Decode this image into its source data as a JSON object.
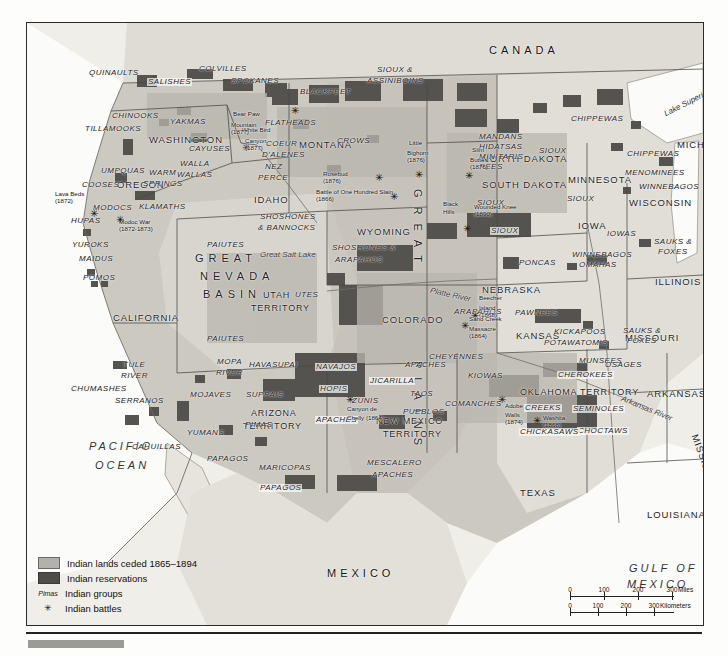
{
  "map": {
    "countries": [
      {
        "name": "CANADA",
        "x": 462,
        "y": 22
      },
      {
        "name": "MEXICO",
        "x": 300,
        "y": 545
      }
    ],
    "oceans": [
      {
        "name": "PACIFIC",
        "x": 62,
        "y": 418
      },
      {
        "name": "OCEAN",
        "x": 68,
        "y": 437
      },
      {
        "name": "GULF OF",
        "x": 602,
        "y": 540
      },
      {
        "name": "MEXICO",
        "x": 600,
        "y": 556
      }
    ],
    "waters": [
      {
        "name": "Lake Superior",
        "x": 636,
        "y": 88,
        "rot": -27
      },
      {
        "name": "Lake Michigan",
        "x": 696,
        "y": 148,
        "rot": 78
      },
      {
        "name": "Great Salt Lake",
        "x": 233,
        "y": 228
      },
      {
        "name": "Platte River",
        "x": 404,
        "y": 264,
        "rot": 12
      },
      {
        "name": "Arkansas River",
        "x": 596,
        "y": 372,
        "rot": 22
      }
    ],
    "regions": [
      {
        "name": "GREAT",
        "x": 396,
        "y": 166,
        "vertical": true
      },
      {
        "name": "PLAINS",
        "x": 396,
        "y": 338,
        "vertical": true
      },
      {
        "name": "GREAT",
        "x": 168,
        "y": 230
      },
      {
        "name": "NEVADA",
        "x": 173,
        "y": 248
      },
      {
        "name": "BASIN",
        "x": 176,
        "y": 266
      }
    ],
    "states": [
      {
        "name": "WASHINGTON",
        "x": 122,
        "y": 112
      },
      {
        "name": "OREGON",
        "x": 90,
        "y": 157
      },
      {
        "name": "IDAHO",
        "x": 227,
        "y": 172
      },
      {
        "name": "MONTANA",
        "x": 272,
        "y": 117
      },
      {
        "name": "WYOMING",
        "x": 330,
        "y": 204
      },
      {
        "name": "COLORADO",
        "x": 355,
        "y": 292
      },
      {
        "name": "NORTH DAKOTA",
        "x": 455,
        "y": 131
      },
      {
        "name": "SOUTH DAKOTA",
        "x": 455,
        "y": 157
      },
      {
        "name": "NEBRASKA",
        "x": 455,
        "y": 262
      },
      {
        "name": "KANSAS",
        "x": 489,
        "y": 308
      },
      {
        "name": "MINNESOTA",
        "x": 541,
        "y": 152
      },
      {
        "name": "IOWA",
        "x": 551,
        "y": 198
      },
      {
        "name": "WISCONSIN",
        "x": 602,
        "y": 175
      },
      {
        "name": "MICHIGAN",
        "x": 650,
        "y": 117
      },
      {
        "name": "ILLINOIS",
        "x": 628,
        "y": 254
      },
      {
        "name": "MISSOURI",
        "x": 598,
        "y": 310
      },
      {
        "name": "ARKANSAS",
        "x": 620,
        "y": 366
      },
      {
        "name": "MISSISSIPPI",
        "x": 672,
        "y": 410,
        "rot": 70
      },
      {
        "name": "LOUISIANA",
        "x": 620,
        "y": 487
      },
      {
        "name": "TEXAS",
        "x": 493,
        "y": 465
      },
      {
        "name": "CALIFORNIA",
        "x": 86,
        "y": 290
      },
      {
        "name": "NEVADA",
        "x": 0,
        "y": 0
      }
    ],
    "territories": [
      {
        "name": "UTAH",
        "x": 236,
        "y": 268
      },
      {
        "name": "TERRITORY",
        "x": 224,
        "y": 281
      },
      {
        "name": "ARIZONA",
        "x": 224,
        "y": 386
      },
      {
        "name": "TERRITORY",
        "x": 216,
        "y": 399
      },
      {
        "name": "NEW MEXICO",
        "x": 349,
        "y": 394
      },
      {
        "name": "TERRITORY",
        "x": 356,
        "y": 407
      },
      {
        "name": "OKLAHOMA TERRITORY",
        "x": 493,
        "y": 365
      }
    ],
    "tribes": [
      {
        "name": "QUINAULTS",
        "x": 62,
        "y": 46
      },
      {
        "name": "COLVILLES",
        "x": 172,
        "y": 42
      },
      {
        "name": "SALISHES",
        "x": 120,
        "y": 55,
        "boxed": true
      },
      {
        "name": "SPOKANES",
        "x": 204,
        "y": 54
      },
      {
        "name": "CHINOOKS",
        "x": 85,
        "y": 89
      },
      {
        "name": "TILLAMOOKS",
        "x": 58,
        "y": 102
      },
      {
        "name": "YAKMAS",
        "x": 143,
        "y": 95
      },
      {
        "name": "CAYUSES",
        "x": 162,
        "y": 122
      },
      {
        "name": "COEUR",
        "x": 239,
        "y": 117
      },
      {
        "name": "D'ALENES",
        "x": 235,
        "y": 128
      },
      {
        "name": "BLACKFEET",
        "x": 273,
        "y": 65
      },
      {
        "name": "FLATHEADS",
        "x": 238,
        "y": 96
      },
      {
        "name": "SIOUX &",
        "x": 350,
        "y": 43
      },
      {
        "name": "ASSINIBOINS",
        "x": 340,
        "y": 54
      },
      {
        "name": "MANDANS",
        "x": 452,
        "y": 110
      },
      {
        "name": "HIDATSAS",
        "x": 452,
        "y": 120
      },
      {
        "name": "MINITARIS",
        "x": 452,
        "y": 130
      },
      {
        "name": "REES",
        "x": 452,
        "y": 140
      },
      {
        "name": "SIOUX",
        "x": 512,
        "y": 124
      },
      {
        "name": "CHIPPEWAS",
        "x": 544,
        "y": 92
      },
      {
        "name": "CHIPPEWAS",
        "x": 600,
        "y": 127
      },
      {
        "name": "MENOMINEES",
        "x": 598,
        "y": 146
      },
      {
        "name": "WINNEBAGOS",
        "x": 612,
        "y": 160
      },
      {
        "name": "CROWS",
        "x": 310,
        "y": 114
      },
      {
        "name": "WALLA",
        "x": 153,
        "y": 137
      },
      {
        "name": "WALLAS",
        "x": 150,
        "y": 148
      },
      {
        "name": "WARM",
        "x": 122,
        "y": 146
      },
      {
        "name": "SPRINGS",
        "x": 116,
        "y": 157
      },
      {
        "name": "NEZ",
        "x": 238,
        "y": 140
      },
      {
        "name": "PERCE",
        "x": 231,
        "y": 151
      },
      {
        "name": "UMPQUAS",
        "x": 74,
        "y": 144
      },
      {
        "name": "COOSES",
        "x": 55,
        "y": 158
      },
      {
        "name": "MODOCS",
        "x": 66,
        "y": 181
      },
      {
        "name": "KLAMATHS",
        "x": 112,
        "y": 180
      },
      {
        "name": "HUPAS",
        "x": 44,
        "y": 194
      },
      {
        "name": "YUROKS",
        "x": 45,
        "y": 218
      },
      {
        "name": "MAIDUS",
        "x": 52,
        "y": 232
      },
      {
        "name": "POMOS",
        "x": 56,
        "y": 251
      },
      {
        "name": "SHOSHONES",
        "x": 233,
        "y": 190
      },
      {
        "name": "& BANNOCKS",
        "x": 231,
        "y": 201
      },
      {
        "name": "PAIUTES",
        "x": 180,
        "y": 218
      },
      {
        "name": "PAIUTES",
        "x": 180,
        "y": 312
      },
      {
        "name": "SHOSHONES &",
        "x": 305,
        "y": 221
      },
      {
        "name": "ARAPAHOS",
        "x": 308,
        "y": 233
      },
      {
        "name": "UTES",
        "x": 268,
        "y": 268
      },
      {
        "name": "SIOUX",
        "x": 450,
        "y": 176
      },
      {
        "name": "SIOUX",
        "x": 463,
        "y": 204,
        "boxed": true
      },
      {
        "name": "SIOUX",
        "x": 540,
        "y": 172
      },
      {
        "name": "PONCAS",
        "x": 492,
        "y": 236
      },
      {
        "name": "IOWAS",
        "x": 580,
        "y": 207
      },
      {
        "name": "WINNEBAGOS",
        "x": 545,
        "y": 228
      },
      {
        "name": "OMAHAS",
        "x": 552,
        "y": 238
      },
      {
        "name": "SAUKS &",
        "x": 627,
        "y": 215
      },
      {
        "name": "FOXES",
        "x": 631,
        "y": 225
      },
      {
        "name": "SAUKS &",
        "x": 596,
        "y": 304
      },
      {
        "name": "FOXES",
        "x": 600,
        "y": 314
      },
      {
        "name": "ARAPAHOS",
        "x": 427,
        "y": 285
      },
      {
        "name": "PAWNEES",
        "x": 488,
        "y": 286
      },
      {
        "name": "KICKAPOOS",
        "x": 527,
        "y": 305
      },
      {
        "name": "POTAWATOMIS",
        "x": 517,
        "y": 316
      },
      {
        "name": "MUNSEES",
        "x": 552,
        "y": 334
      },
      {
        "name": "CHEYENNES",
        "x": 402,
        "y": 330
      },
      {
        "name": "TULE",
        "x": 96,
        "y": 338
      },
      {
        "name": "RIVER",
        "x": 94,
        "y": 349
      },
      {
        "name": "CHUMASHES",
        "x": 44,
        "y": 362
      },
      {
        "name": "MOPA",
        "x": 190,
        "y": 335
      },
      {
        "name": "RIVER",
        "x": 189,
        "y": 346
      },
      {
        "name": "HAVASUPAI",
        "x": 222,
        "y": 338
      },
      {
        "name": "SUPPAIS",
        "x": 219,
        "y": 368
      },
      {
        "name": "NAVAJOS",
        "x": 288,
        "y": 340,
        "boxed": true
      },
      {
        "name": "HOPIS",
        "x": 292,
        "y": 362,
        "boxed": true
      },
      {
        "name": "ZUNIS",
        "x": 325,
        "y": 374
      },
      {
        "name": "JICARILLA",
        "x": 342,
        "y": 354,
        "boxed": true
      },
      {
        "name": "APACHES",
        "x": 378,
        "y": 338
      },
      {
        "name": "TAOS",
        "x": 383,
        "y": 367
      },
      {
        "name": "PUEBLOS",
        "x": 376,
        "y": 385
      },
      {
        "name": "APACHES",
        "x": 288,
        "y": 393,
        "boxed": true
      },
      {
        "name": "MOJAVES",
        "x": 163,
        "y": 368
      },
      {
        "name": "SERRANOS",
        "x": 88,
        "y": 374
      },
      {
        "name": "YUMANS",
        "x": 160,
        "y": 406
      },
      {
        "name": "CAHUILLAS",
        "x": 105,
        "y": 420
      },
      {
        "name": "PIMAS",
        "x": 218,
        "y": 398
      },
      {
        "name": "PAPAGOS",
        "x": 180,
        "y": 432
      },
      {
        "name": "MARICOPAS",
        "x": 232,
        "y": 441
      },
      {
        "name": "PAPAGOS",
        "x": 232,
        "y": 461,
        "boxed": true
      },
      {
        "name": "MESCALERO",
        "x": 340,
        "y": 436
      },
      {
        "name": "APACHES",
        "x": 345,
        "y": 448
      },
      {
        "name": "KIOWAS",
        "x": 441,
        "y": 349
      },
      {
        "name": "COMANCHES",
        "x": 418,
        "y": 377
      },
      {
        "name": "CHEROKEES",
        "x": 530,
        "y": 348,
        "boxed": true
      },
      {
        "name": "OSAGES",
        "x": 578,
        "y": 338
      },
      {
        "name": "CREEKS",
        "x": 497,
        "y": 381,
        "boxed": true
      },
      {
        "name": "SEMINOLES",
        "x": 545,
        "y": 382,
        "boxed": true
      },
      {
        "name": "CHOCTAWS",
        "x": 550,
        "y": 404,
        "boxed": true
      },
      {
        "name": "CHICKASAWS",
        "x": 492,
        "y": 405,
        "boxed": true
      }
    ],
    "battles": [
      {
        "name": "Lava Beds",
        "year": "(1872)",
        "x": 28,
        "y": 168,
        "star_x": 62,
        "star_y": 186,
        "leader": true
      },
      {
        "name": "Modoc War",
        "year": "(1872-1873)",
        "x": 92,
        "y": 196,
        "star_x": 88,
        "star_y": 192
      },
      {
        "name": "White Bird",
        "year": "",
        "x": 215,
        "y": 104,
        "star_x": 214,
        "star_y": 120
      },
      {
        "name": "Canyon",
        "year": "(1877)",
        "x": 218,
        "y": 115,
        "star_x": -1,
        "star_y": -1
      },
      {
        "name": "Bear Paw",
        "year": "",
        "x": 206,
        "y": 88,
        "star_x": 263,
        "star_y": 83
      },
      {
        "name": "Mountain",
        "year": "(1877)",
        "x": 204,
        "y": 99,
        "star_x": -1,
        "star_y": -1
      },
      {
        "name": "Little",
        "year": "",
        "x": 382,
        "y": 117,
        "star_x": 387,
        "star_y": 147
      },
      {
        "name": "Bighorn",
        "year": "(1876)",
        "x": 380,
        "y": 127,
        "star_x": -1,
        "star_y": -1
      },
      {
        "name": "Rosebud",
        "year": "(1876)",
        "x": 296,
        "y": 148,
        "star_x": 347,
        "star_y": 150
      },
      {
        "name": "Slim",
        "year": "",
        "x": 445,
        "y": 124,
        "star_x": 437,
        "star_y": 148
      },
      {
        "name": "Buttes",
        "year": "(1876)",
        "x": 443,
        "y": 134,
        "star_x": -1,
        "star_y": -1
      },
      {
        "name": "Battle of One Hundred Slain",
        "year": "(1866)",
        "x": 289,
        "y": 166,
        "star_x": 362,
        "star_y": 169
      },
      {
        "name": "Wounded Knee",
        "year": "(1890)",
        "x": 447,
        "y": 181,
        "star_x": 435,
        "star_y": 201
      },
      {
        "name": "Beecher",
        "year": "",
        "x": 452,
        "y": 272,
        "star_x": 443,
        "star_y": 288
      },
      {
        "name": "Island",
        "year": "(1868)",
        "x": 452,
        "y": 282,
        "star_x": -1,
        "star_y": -1
      },
      {
        "name": "Sand Creek",
        "year": "",
        "x": 442,
        "y": 293,
        "star_x": 433,
        "star_y": 298
      },
      {
        "name": "Massacre",
        "year": "(1864)",
        "x": 442,
        "y": 303,
        "star_x": -1,
        "star_y": -1
      },
      {
        "name": "Canyon de",
        "year": "",
        "x": 320,
        "y": 383,
        "star_x": 318,
        "star_y": 372
      },
      {
        "name": "Chelly (1864)",
        "year": "",
        "x": 320,
        "y": 392,
        "star_x": -1,
        "star_y": -1
      },
      {
        "name": "Adobe",
        "year": "",
        "x": 478,
        "y": 380,
        "star_x": 470,
        "star_y": 372
      },
      {
        "name": "Walls",
        "year": "(1874)",
        "x": 478,
        "y": 389,
        "star_x": -1,
        "star_y": -1
      },
      {
        "name": "Washita",
        "year": "(1868)",
        "x": 516,
        "y": 392,
        "star_x": 505,
        "star_y": 393
      },
      {
        "name": "Black",
        "year": "",
        "x": 416,
        "y": 178,
        "star_x": -1,
        "star_y": -1
      },
      {
        "name": "Hills",
        "year": "",
        "x": 416,
        "y": 186,
        "star_x": -1,
        "star_y": -1
      }
    ]
  },
  "legend": {
    "items": [
      {
        "key": "ceded",
        "label": "Indian lands ceded 1865–1894"
      },
      {
        "key": "reservations",
        "label": "Indian reservations"
      },
      {
        "key": "Pimas",
        "label": "Indian groups"
      },
      {
        "key": "star",
        "label": "Indian battles"
      }
    ]
  },
  "scale": {
    "miles": {
      "ticks": [
        "0",
        "100",
        "200",
        "300"
      ],
      "unit": "Miles"
    },
    "kilometers": {
      "ticks": [
        "0",
        "100",
        "200",
        "300"
      ],
      "unit": "Kilometers"
    }
  },
  "colors": {
    "ceded": "#b3b1ab",
    "reservation": "#4e4d4a",
    "land": "#d8d6cf",
    "water": "#fbfbf9",
    "border": "#2b2b2b"
  }
}
